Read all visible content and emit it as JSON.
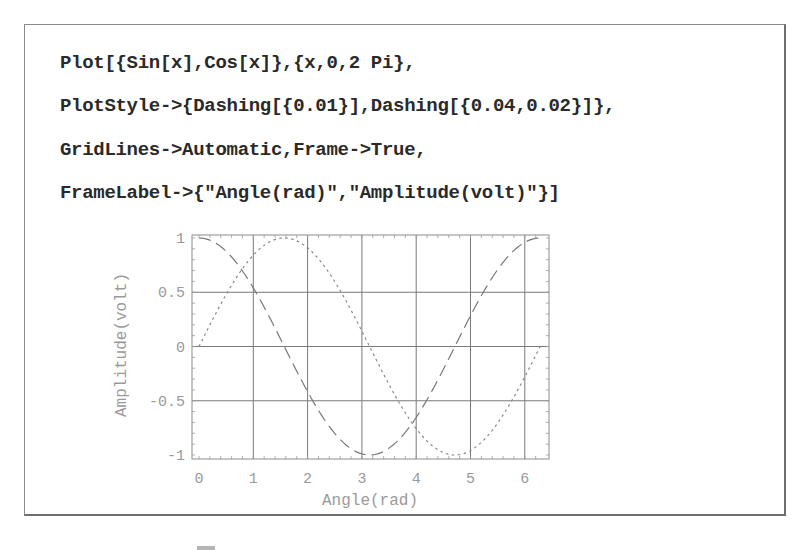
{
  "code": {
    "lines": [
      "Plot[{Sin[x],Cos[x]},{x,0,2 Pi},",
      "PlotStyle->{Dashing[{0.01}],Dashing[{0.04,0.02}]},",
      "GridLines->Automatic,Frame->True,",
      "FrameLabel->{\"Angle(rad)\",\"Amplitude(volt)\"}]"
    ]
  },
  "chart_data": {
    "type": "line",
    "title": "",
    "xlabel": "Angle(rad)",
    "ylabel": "Amplitude(volt)",
    "xlim": [
      0,
      6.283
    ],
    "ylim": [
      -1,
      1
    ],
    "grid": true,
    "frame": true,
    "x_ticks": [
      "0",
      "1",
      "2",
      "3",
      "4",
      "5",
      "6"
    ],
    "y_ticks": [
      "1",
      "0.5",
      "0",
      "-0.5",
      "-1"
    ],
    "series": [
      {
        "name": "Sin[x]",
        "style": "dotted (Dashing[{0.01}])",
        "x": [
          0,
          0.5,
          1,
          1.5708,
          2,
          2.5,
          3,
          3.1416,
          3.5,
          4,
          4.5,
          4.7124,
          5,
          5.5,
          6,
          6.2832
        ],
        "values": [
          0,
          0.479,
          0.841,
          1,
          0.909,
          0.598,
          0.141,
          0,
          -0.351,
          -0.757,
          -0.978,
          -1,
          -0.959,
          -0.706,
          -0.279,
          0
        ]
      },
      {
        "name": "Cos[x]",
        "style": "dashed (Dashing[{0.04,0.02}])",
        "x": [
          0,
          0.5,
          1,
          1.5708,
          2,
          2.5,
          3,
          3.1416,
          3.5,
          4,
          4.5,
          4.7124,
          5,
          5.5,
          6,
          6.2832
        ],
        "values": [
          1,
          0.878,
          0.54,
          0,
          -0.416,
          -0.801,
          -0.99,
          -1,
          -0.936,
          -0.654,
          -0.211,
          0,
          0.284,
          0.709,
          0.96,
          1
        ]
      }
    ],
    "legend": null
  }
}
